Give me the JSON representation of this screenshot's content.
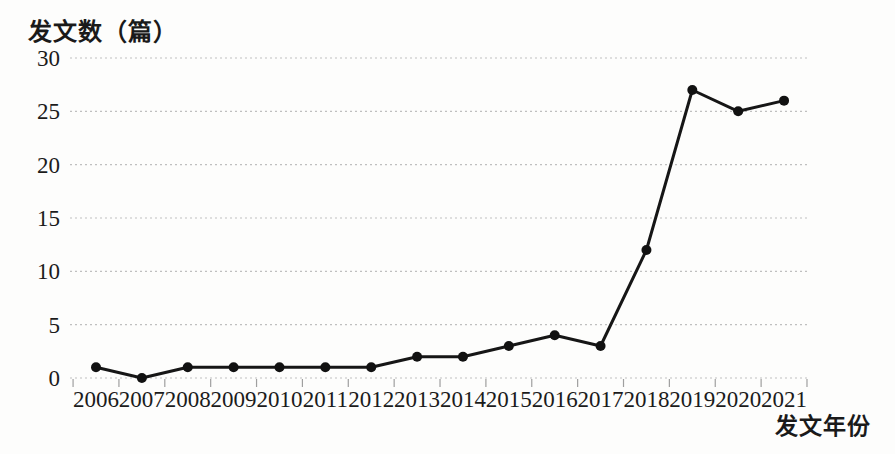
{
  "chart_data": {
    "type": "line",
    "title": "",
    "ylabel": "发文数（篇）",
    "xlabel": "发文年份",
    "categories": [
      "2006",
      "2007",
      "2008",
      "2009",
      "2010",
      "2011",
      "2012",
      "2013",
      "2014",
      "2015",
      "2016",
      "2017",
      "2018",
      "2019",
      "2020",
      "2021"
    ],
    "series": [
      {
        "name": "发文数",
        "values": [
          1,
          0,
          1,
          1,
          1,
          1,
          1,
          2,
          2,
          3,
          4,
          3,
          12,
          27,
          25,
          26
        ]
      }
    ],
    "ylim": [
      0,
      30
    ],
    "yticks": [
      0,
      5,
      10,
      15,
      20,
      25,
      30
    ],
    "grid": "horizontal-dashed",
    "legend": "none",
    "marker": "circle",
    "line_color": "#161616",
    "marker_color": "#111111",
    "grid_color": "#bfbfbf",
    "axis_color": "#9f9f9f",
    "text_color": "#1b1b1b"
  }
}
